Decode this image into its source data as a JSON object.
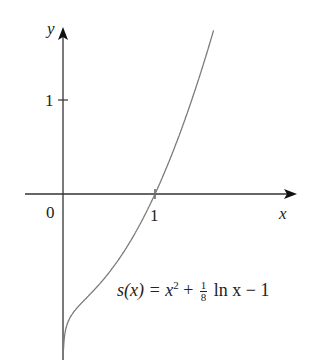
{
  "chart_data": {
    "type": "line",
    "title": "",
    "xlabel": "x",
    "ylabel": "y",
    "x_ticks": [
      {
        "value": 1,
        "label": "1"
      }
    ],
    "y_ticks": [
      {
        "value": 1,
        "label": "1"
      }
    ],
    "origin_label": "0",
    "xlim": [
      0,
      2.5
    ],
    "ylim": [
      -1.7,
      1.8
    ],
    "grid": false,
    "legend": null,
    "annotation": "s(x) = x^2 + (1/8) ln x - 1",
    "series": [
      {
        "name": "s(x) = x^2 + 1/8 ln x - 1",
        "x": [
          0.01,
          0.05,
          0.1,
          0.2,
          0.3,
          0.4,
          0.5,
          0.6,
          0.7,
          0.8,
          0.9,
          1.0,
          1.1,
          1.2,
          1.3,
          1.4,
          1.5,
          1.6,
          1.64
        ],
        "y": [
          -1.58,
          -1.37,
          -1.28,
          -1.16,
          -1.06,
          -0.95,
          -0.84,
          -0.7,
          -0.55,
          -0.39,
          -0.2,
          0.0,
          0.22,
          0.46,
          0.72,
          1.0,
          1.3,
          1.62,
          1.75
        ]
      }
    ],
    "colors": {
      "axis": "#222222",
      "curve": "#777777"
    }
  },
  "labels": {
    "y_axis": "y",
    "x_axis": "x",
    "origin": "0",
    "x_tick_1": "1",
    "y_tick_1": "1",
    "formula_lhs": "s(x) = x",
    "formula_exp": "2",
    "formula_plus": " + ",
    "frac_num": "1",
    "frac_den": "8",
    "formula_rest": " ln x − 1"
  }
}
